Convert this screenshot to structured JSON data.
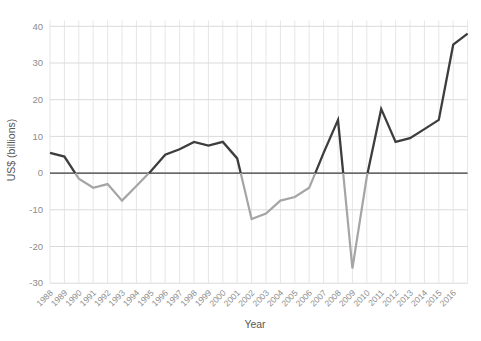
{
  "chart_data": {
    "type": "line",
    "title": "",
    "xlabel": "Year",
    "ylabel": "US$ (billions)",
    "x_tick_labels": [
      "1988",
      "1989",
      "1990",
      "1991",
      "1992",
      "1993",
      "1994",
      "1995",
      "1996",
      "1997",
      "1998",
      "1999",
      "2000",
      "2001",
      "2002",
      "2003",
      "2004",
      "2005",
      "2006",
      "2007",
      "2008",
      "2009",
      "2010",
      "2011",
      "2012",
      "2013",
      "2014",
      "2015",
      "2016"
    ],
    "years": [
      1988,
      1989,
      1990,
      1991,
      1992,
      1993,
      1994,
      1995,
      1996,
      1997,
      1998,
      1999,
      2000,
      2001,
      2002,
      2003,
      2004,
      2005,
      2006,
      2007,
      2008,
      2009,
      2010,
      2011,
      2012,
      2013,
      2014,
      2015,
      2016,
      2017
    ],
    "values": [
      5.5,
      4.5,
      -1.5,
      -4,
      -3,
      -7.5,
      -3.5,
      0.5,
      5,
      6.5,
      8.5,
      7.5,
      8.5,
      4,
      -12.5,
      -11,
      -7.5,
      -6.5,
      -4,
      5.5,
      14.5,
      -26,
      -1,
      17.5,
      8.5,
      9.5,
      12,
      14.5,
      35,
      38
    ],
    "note": "final line point at right plot edge is unlabeled on the x axis",
    "y_ticks": [
      40,
      30,
      20,
      10,
      0,
      -10,
      -20,
      -30
    ],
    "ylim": [
      -30,
      40
    ],
    "grid": true,
    "legend": "none",
    "line_color_rule": "segments above zero are dark charcoal, segments below zero are light gray"
  },
  "colors": {
    "background": "#ffffff",
    "line_positive": "#3d3d3d",
    "line_negative": "#a5a5a5",
    "zero_line": "#3c3c3c",
    "grid_horizontal": "#dadada",
    "grid_vertical": "#e6e6e6",
    "tick_label": "#8c8c8c",
    "axis_title": "#575757"
  }
}
